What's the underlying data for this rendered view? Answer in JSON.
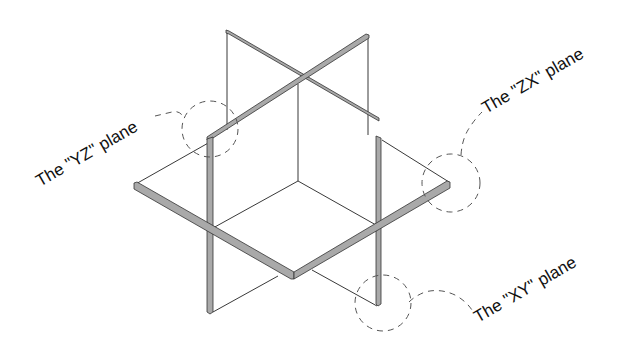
{
  "diagram": {
    "type": "isometric-planes",
    "colors": {
      "background": "#ffffff",
      "edge_fill": "#a9a9a9",
      "line": "#222222",
      "callout_dash": "#555555"
    },
    "labels": {
      "yz": "The \"YZ\" plane",
      "zx": "The \"ZX\" plane",
      "xy": "The \"XY\" plane"
    }
  }
}
